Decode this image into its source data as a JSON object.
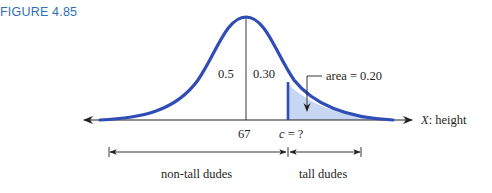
{
  "figure_label": "FIGURE 4.85",
  "diagram": {
    "type": "normal-distribution",
    "mean_label": "67",
    "cutoff_label_var": "c",
    "cutoff_label_rest": " = ?",
    "left_area_label": "0.5",
    "middle_area_label": "0.30",
    "tail_area_callout": "area = 0.20",
    "axis_label_var": "X",
    "axis_label_rest": ": height",
    "left_group_label": "non-tall dudes",
    "right_group_label": "tall dudes",
    "colors": {
      "curve": "#2f4db5",
      "shade": "#c7d6f2",
      "axis": "#231f20",
      "figure_label": "#2f6fb5"
    }
  }
}
